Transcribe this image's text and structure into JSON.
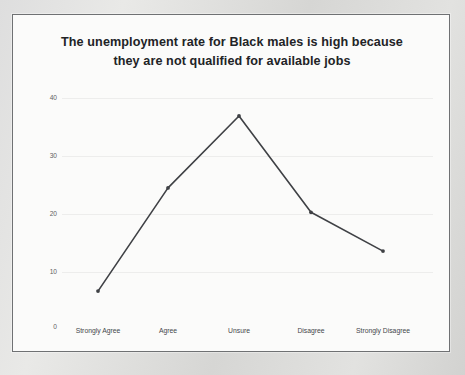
{
  "chart_data": {
    "type": "line",
    "title": "The unemployment rate for Black males is high because they are not qualified for available jobs",
    "title_line1": "The unemployment rate for Black males is high because",
    "title_line2": "they are not qualified for available jobs",
    "xlabel": "",
    "ylabel": "",
    "categories": [
      "Strongly Agree",
      "Agree",
      "Unsure",
      "Disagree",
      "Strongly Disagree"
    ],
    "values": [
      6.7,
      24.5,
      36.9,
      20.3,
      13.6
    ],
    "series": [
      {
        "name": "Percent of respondents",
        "values": [
          6.7,
          24.5,
          36.9,
          20.3,
          13.6
        ]
      }
    ],
    "ylim": [
      0,
      40
    ],
    "ytick_labels": [
      "0",
      "10",
      "20",
      "30",
      "40"
    ],
    "ytick_values": [
      0,
      10,
      20,
      30,
      40
    ],
    "grid": true,
    "grid_axis": "y",
    "legend": false,
    "legend_position": "none",
    "markers": true,
    "line_color": "#3f4145",
    "grid_color": "#ededec",
    "text_color": "#44464a",
    "title_color": "#222326",
    "plot_background": "#fbfbfa"
  },
  "figure": {
    "border_color": "#6f7173",
    "page_background": "#d8d8d6"
  }
}
